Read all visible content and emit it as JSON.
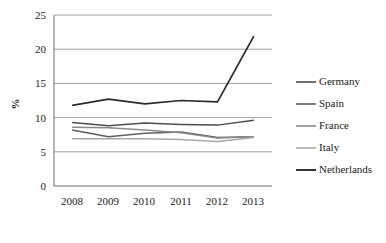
{
  "chart_data": {
    "type": "line",
    "title": "",
    "xlabel": "",
    "ylabel": "%",
    "categories": [
      "2008",
      "2009",
      "2010",
      "2011",
      "2012",
      "2013"
    ],
    "x": [
      2008,
      2009,
      2010,
      2011,
      2012,
      2013
    ],
    "ylim": [
      0,
      25
    ],
    "yticks": [
      0,
      5,
      10,
      15,
      20,
      25
    ],
    "ytick_labels": [
      "0",
      "5",
      "10",
      "15",
      "20",
      "25"
    ],
    "grid": "horizontal",
    "legend_position": "right",
    "series": [
      {
        "name": "Germany",
        "values": [
          9.3,
          8.8,
          9.2,
          9.0,
          8.9,
          9.6
        ],
        "color": "#4d4d4d"
      },
      {
        "name": "Spain",
        "values": [
          8.2,
          7.2,
          7.7,
          7.9,
          7.1,
          7.2
        ],
        "color": "#5f5f5f"
      },
      {
        "name": "France",
        "values": [
          8.6,
          8.5,
          8.2,
          7.8,
          7.0,
          7.2
        ],
        "color": "#8a8a8a"
      },
      {
        "name": "Italy",
        "values": [
          6.9,
          6.9,
          6.9,
          6.8,
          6.5,
          7.1
        ],
        "color": "#a8a8a8"
      },
      {
        "name": "Netherlands",
        "values": [
          11.8,
          12.7,
          12.0,
          12.5,
          12.3,
          21.9
        ],
        "color": "#2b2b2b"
      }
    ]
  },
  "axis": {
    "y_label": "%",
    "y_tick_labels": [
      "25",
      "20",
      "15",
      "10",
      "5",
      "0"
    ],
    "x_tick_labels": [
      "2008",
      "2009",
      "2010",
      "2011",
      "2012",
      "2013"
    ]
  },
  "legend": {
    "items": [
      {
        "label": "Germany"
      },
      {
        "label": "Spain"
      },
      {
        "label": "France"
      },
      {
        "label": "Italy"
      },
      {
        "label": "Netherlands"
      }
    ]
  }
}
